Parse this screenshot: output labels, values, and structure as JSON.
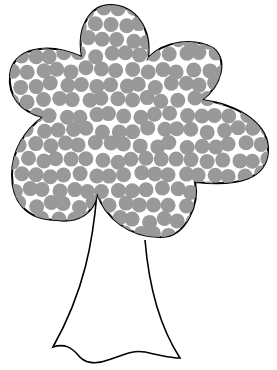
{
  "illustration": {
    "subject": "tree",
    "canopy": {
      "fill": "#ffffff",
      "stroke": "#000000",
      "dot_color": "#999999",
      "dot_radius": 7.5
    },
    "trunk": {
      "fill": "#ffffff",
      "stroke": "#000000"
    },
    "background": "#ffffff"
  }
}
